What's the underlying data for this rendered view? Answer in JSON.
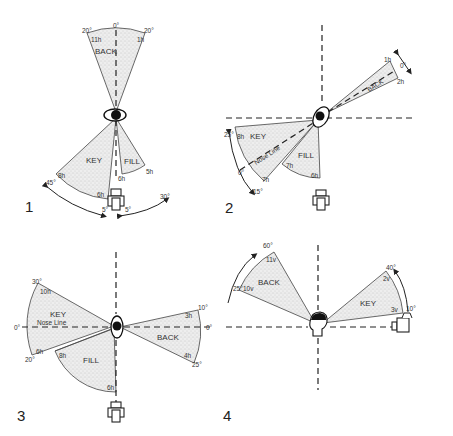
{
  "figure": {
    "background": "#ffffff",
    "ink_color": "#222222",
    "sector_fill": "#e4e4e4",
    "panels": [
      {
        "number": "1",
        "view": "top",
        "sectors": [
          {
            "name": "BACK",
            "angles": [
              "20°",
              "0°",
              "20°"
            ],
            "heights": [
              "11h",
              "1h"
            ]
          },
          {
            "name": "KEY",
            "angles": [
              "45°",
              "5°"
            ],
            "heights": [
              "8h",
              "6h"
            ]
          },
          {
            "name": "FILL",
            "angles": [
              "30°",
              "5°"
            ],
            "heights": [
              "5h",
              "6h"
            ]
          }
        ],
        "labels": {
          "back": "BACK",
          "key": "KEY",
          "fill": "FILL",
          "back_left_angle": "20°",
          "back_center_angle": "0°",
          "back_right_angle": "20°",
          "back_left_height": "11h",
          "back_right_height": "1h",
          "key_angle_outer": "45°",
          "key_height_outer": "8h",
          "key_height_inner": "6h",
          "fill_height": "5h",
          "center_height": "6h",
          "bottom_left_angle": "5°",
          "bottom_right_angle": "5°",
          "fill_angle": "30°"
        }
      },
      {
        "number": "2",
        "view": "top",
        "labels": {
          "back": "BACK",
          "key": "KEY",
          "fill": "FILL",
          "nose_line": "Nose Line",
          "back_height_top": "1h",
          "back_height_bottom": "2h",
          "back_angle": "0°",
          "key_angle_top": "25°",
          "key_angle_bottom": "15°",
          "key_height": "8h",
          "nose_angle": "0°",
          "key_inner_height": "7h",
          "fill_height_a": "7h",
          "fill_height_b": "6h"
        }
      },
      {
        "number": "3",
        "view": "top",
        "labels": {
          "back": "BACK",
          "key": "KEY",
          "fill": "FILL",
          "nose_line": "Nose Line",
          "key_angle_top": "30°",
          "key_height_top": "10h",
          "left_angle": "0°",
          "key_angle_bottom": "20°",
          "key_height_bottom": "6h",
          "fill_height_top": "8h",
          "fill_height_bottom": "6h",
          "back_angle_top": "10°",
          "back_height_top": "3h",
          "right_angle": "0°",
          "back_height_bottom": "4h",
          "back_angle_bottom": "25°"
        }
      },
      {
        "number": "4",
        "view": "side",
        "labels": {
          "back": "BACK",
          "key": "KEY",
          "back_angle_top": "60°",
          "back_height_top": "11v",
          "back_angle_bottom": "25°",
          "back_height_bottom": "10v",
          "key_angle_top": "40°",
          "key_height_top": "2v",
          "key_angle_bottom": "10°",
          "key_height_bottom": "3v"
        }
      }
    ]
  }
}
